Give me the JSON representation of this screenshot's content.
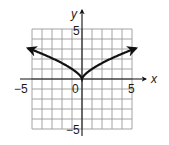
{
  "chart_data": {
    "type": "line",
    "title": "",
    "xlabel": "x",
    "ylabel": "y",
    "xlim": [
      -5,
      5
    ],
    "ylim": [
      -5,
      5
    ],
    "grid": true,
    "grid_step": 1,
    "x_tick_labels": [
      "-5",
      "0",
      "5"
    ],
    "y_tick_labels": [
      "5",
      "-5"
    ],
    "function": "y = x^(2/3)",
    "series": [
      {
        "name": "curve",
        "x": [
          -5.4,
          -5,
          -4,
          -3,
          -2,
          -1,
          0,
          1,
          2,
          3,
          4,
          5,
          5.4
        ],
        "y": [
          3.08,
          2.92,
          2.52,
          2.08,
          1.59,
          1.0,
          0,
          1.0,
          1.59,
          2.08,
          2.52,
          2.92,
          3.08
        ],
        "arrows_at_ends": true
      }
    ]
  },
  "labels": {
    "x_axis": "x",
    "y_axis": "y",
    "x_min": "−5",
    "x_zero": "0",
    "x_max": "5",
    "y_max": "5",
    "y_min": "−5"
  },
  "colors": {
    "grid": "#9a9a9a",
    "axis": "#111111",
    "curve": "#111111"
  }
}
